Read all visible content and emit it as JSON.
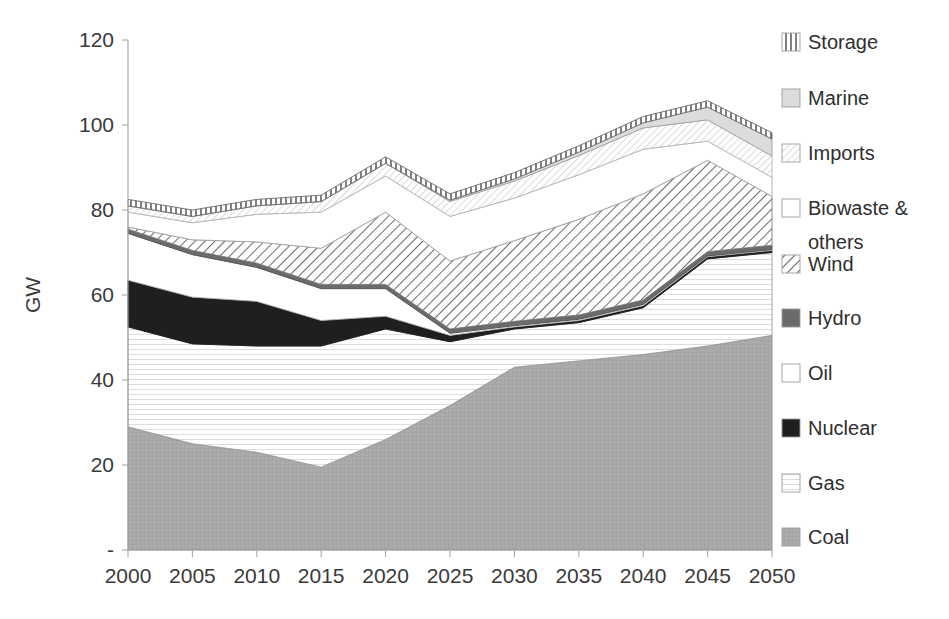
{
  "chart_data": {
    "type": "area",
    "stacked": true,
    "title": "",
    "subtitle": "",
    "xlabel": "",
    "ylabel": "GW",
    "x": [
      2000,
      2005,
      2010,
      2015,
      2020,
      2025,
      2030,
      2035,
      2040,
      2045,
      2050
    ],
    "categories": [
      "2000",
      "2005",
      "2010",
      "2015",
      "2020",
      "2025",
      "2030",
      "2035",
      "2040",
      "2045",
      "2050"
    ],
    "xlim": [
      2000,
      2050
    ],
    "ylim": [
      0,
      120
    ],
    "ytick_labels": [
      "-",
      "20",
      "40",
      "60",
      "80",
      "100",
      "120"
    ],
    "ytick_values": [
      0,
      20,
      40,
      60,
      80,
      100,
      120
    ],
    "grid": false,
    "legend_position": "right",
    "stack_order_bottom_to_top": [
      "Coal",
      "Gas",
      "Nuclear",
      "Oil",
      "Hydro",
      "Wind",
      "Biowaste & others",
      "Imports",
      "Marine",
      "Storage"
    ],
    "series": [
      {
        "name": "Coal",
        "values": [
          29.0,
          25.0,
          23.0,
          19.5,
          26.0,
          34.0,
          43.0,
          44.5,
          46.0,
          48.0,
          50.5
        ]
      },
      {
        "name": "Gas",
        "values": [
          23.5,
          23.5,
          25.0,
          28.5,
          26.0,
          15.0,
          9.0,
          9.0,
          11.0,
          20.5,
          19.5
        ]
      },
      {
        "name": "Nuclear",
        "values": [
          11.0,
          11.0,
          10.5,
          6.0,
          3.0,
          1.5,
          0.5,
          0.5,
          0.5,
          0.5,
          0.5
        ]
      },
      {
        "name": "Oil",
        "values": [
          11.0,
          10.0,
          8.0,
          7.5,
          6.5,
          0.5,
          0.3,
          0.3,
          0.3,
          0.2,
          0.2
        ]
      },
      {
        "name": "Hydro",
        "values": [
          1.0,
          1.0,
          1.0,
          1.0,
          1.0,
          1.0,
          1.0,
          1.0,
          1.0,
          1.0,
          1.0
        ]
      },
      {
        "name": "Wind",
        "values": [
          0.5,
          2.5,
          5.0,
          8.5,
          17.0,
          16.0,
          19.0,
          22.5,
          25.0,
          21.5,
          11.5
        ]
      },
      {
        "name": "Biowaste & others",
        "values": [
          3.5,
          4.0,
          6.5,
          8.5,
          8.5,
          10.5,
          10.0,
          10.5,
          10.5,
          4.5,
          4.5
        ]
      },
      {
        "name": "Imports",
        "values": [
          1.5,
          1.5,
          2.0,
          2.5,
          3.0,
          3.5,
          4.0,
          4.5,
          5.0,
          5.0,
          5.0
        ]
      },
      {
        "name": "Marine",
        "values": [
          0.0,
          0.0,
          0.0,
          0.0,
          0.0,
          0.3,
          0.5,
          0.8,
          1.2,
          3.0,
          4.0
        ]
      },
      {
        "name": "Storage",
        "values": [
          1.5,
          1.5,
          1.5,
          1.5,
          1.5,
          1.5,
          1.5,
          1.5,
          1.5,
          1.5,
          1.5
        ]
      }
    ],
    "legend_entries": [
      {
        "label": "Storage",
        "pattern": "vertical-lines"
      },
      {
        "label": "Marine",
        "pattern": "light-gray-fill"
      },
      {
        "label": "Imports",
        "pattern": "fine-dots"
      },
      {
        "label": "Biowaste & others",
        "pattern": "white-fill"
      },
      {
        "label": "Wind",
        "pattern": "diagonal-lines"
      },
      {
        "label": "Hydro",
        "pattern": "dark-gray-fill"
      },
      {
        "label": "Oil",
        "pattern": "white-fill"
      },
      {
        "label": "Nuclear",
        "pattern": "black-fill"
      },
      {
        "label": "Gas",
        "pattern": "white-fill"
      },
      {
        "label": "Coal",
        "pattern": "medium-gray-fill"
      }
    ]
  },
  "axes": {
    "y_title": "GW",
    "y_ticks": [
      "120",
      "100",
      "80",
      "60",
      "40",
      "20",
      "-"
    ],
    "x_ticks": [
      "2000",
      "2005",
      "2010",
      "2015",
      "2020",
      "2025",
      "2030",
      "2035",
      "2040",
      "2045",
      "2050"
    ]
  },
  "legend": {
    "items": [
      {
        "label": "Storage"
      },
      {
        "label": "Marine"
      },
      {
        "label": "Imports"
      },
      {
        "label": "Biowaste &"
      },
      {
        "label": "others"
      },
      {
        "label": "Wind"
      },
      {
        "label": "Hydro"
      },
      {
        "label": "Oil"
      },
      {
        "label": "Nuclear"
      },
      {
        "label": "Gas"
      },
      {
        "label": "Coal"
      }
    ]
  },
  "colors": {
    "coal": "#a6a6a6",
    "gas": "#ffffff",
    "nuclear": "#1a1a1a",
    "oil": "#fcfcfc",
    "hydro": "#595959",
    "wind": "#ffffff",
    "biowaste": "#ffffff",
    "imports": "#fafafa",
    "marine": "#e0e0e0",
    "storage": "#ffffff",
    "axis": "#a8a8a8",
    "text": "#2f2f2f",
    "stroke": "#7a7a7a"
  }
}
